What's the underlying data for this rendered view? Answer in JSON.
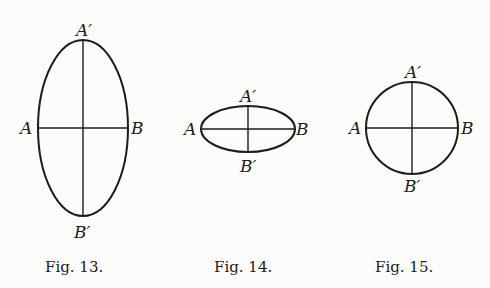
{
  "figures": [
    {
      "id": "fig13",
      "caption": "Fig. 13.",
      "shape": "ellipse",
      "center": [
        83,
        128
      ],
      "rx": 45,
      "ry": 88,
      "labels": {
        "left": "A",
        "right": "B",
        "top": "A′",
        "bottom": "B′"
      }
    },
    {
      "id": "fig14",
      "caption": "Fig. 14.",
      "shape": "ellipse",
      "center": [
        248,
        129
      ],
      "rx": 47,
      "ry": 23,
      "labels": {
        "left": "A",
        "right": "B",
        "top": "A′",
        "bottom": "B′"
      }
    },
    {
      "id": "fig15",
      "caption": "Fig. 15.",
      "shape": "circle",
      "center": [
        412,
        128
      ],
      "rx": 46,
      "ry": 46,
      "labels": {
        "left": "A",
        "right": "B",
        "top": "A′",
        "bottom": "B′"
      }
    }
  ]
}
